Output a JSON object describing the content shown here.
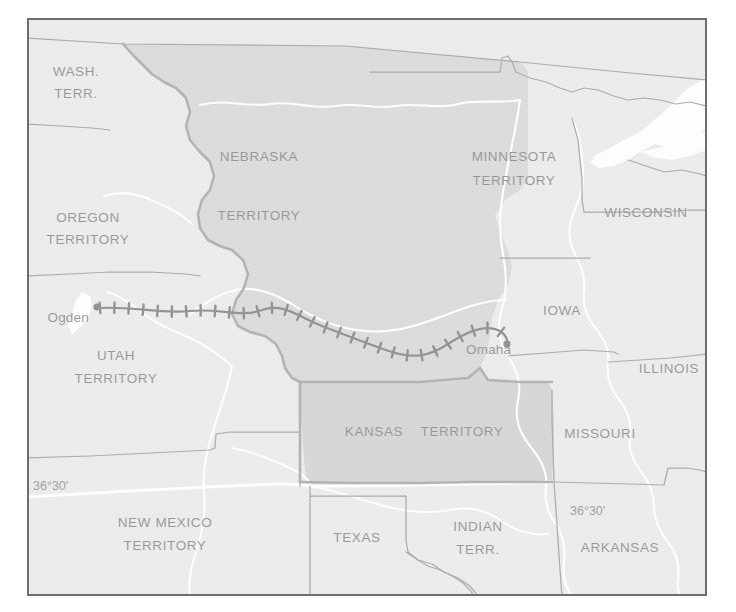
{
  "figure": {
    "kind": "historical-map",
    "frame": {
      "x": 27,
      "y": 18,
      "width": 680,
      "height": 578
    },
    "page_background": "#ffffff",
    "border_color": "#6e6e6e"
  },
  "palette": {
    "page_background": "#ffffff",
    "state_fill_light": "#d6d6d6",
    "territory_fill_mid": "#b4b4b4",
    "territory_fill_dark": "#a8a8a8",
    "water_fill": "#ffffff",
    "river_color": "#ffffff",
    "boundary_thin": "#4a4a4a",
    "boundary_thick": "#5a5a5a",
    "railroad_color": "#141414",
    "label_color": "#1a1a1a",
    "frame_border": "#6e6e6e"
  },
  "regions": [
    {
      "id": "wash-terr",
      "label": "WASH.\nTERR.",
      "lines": [
        "WASH.",
        "TERR."
      ],
      "label_x": 76,
      "label_y": 80,
      "fill": "state_fill_light"
    },
    {
      "id": "oregon-terr",
      "label": "OREGON\nTERRITORY",
      "lines": [
        "OREGON",
        "TERRITORY"
      ],
      "label_x": 88,
      "label_y": 228,
      "fill": "state_fill_light"
    },
    {
      "id": "utah-terr",
      "label": "UTAH\nTERRITORY",
      "lines": [
        "UTAH",
        "TERRITORY"
      ],
      "label_x": 116,
      "label_y": 366,
      "fill": "state_fill_light"
    },
    {
      "id": "new-mexico-terr",
      "label": "NEW MEXICO\nTERRITORY",
      "lines": [
        "NEW MEXICO",
        "TERRITORY"
      ],
      "label_x": 165,
      "label_y": 533,
      "fill": "state_fill_light"
    },
    {
      "id": "nebraska-terr",
      "label": "NEBRASKA\nTERRITORY",
      "lines": [
        "NEBRASKA",
        "TERRITORY"
      ],
      "label_x": 259,
      "label_y": 155,
      "fill": "territory_fill_mid"
    },
    {
      "id": "kansas-terr",
      "label": "KANSAS   TERRITORY",
      "lines": [
        "KANSAS   TERRITORY"
      ],
      "label_x": 400,
      "label_y": 432,
      "fill": "territory_fill_dark"
    },
    {
      "id": "minnesota-terr",
      "label": "MINNESOTA\nTERRITORY",
      "lines": [
        "MINNESOTA",
        "TERRITORY"
      ],
      "label_x": 514,
      "label_y": 155,
      "fill": "state_fill_light"
    },
    {
      "id": "wisconsin",
      "label": "WISCONSIN",
      "lines": [
        "WISCONSIN"
      ],
      "label_x": 642,
      "label_y": 213,
      "fill": "state_fill_light"
    },
    {
      "id": "iowa",
      "label": "IOWA",
      "lines": [
        "IOWA"
      ],
      "label_x": 560,
      "label_y": 311,
      "fill": "state_fill_light"
    },
    {
      "id": "illinois",
      "label": "ILLINOIS",
      "lines": [
        "ILLINOIS"
      ],
      "label_x": 667,
      "label_y": 369,
      "fill": "state_fill_light"
    },
    {
      "id": "missouri",
      "label": "MISSOURI",
      "lines": [
        "MISSOURI"
      ],
      "label_x": 599,
      "label_y": 434,
      "fill": "state_fill_light"
    },
    {
      "id": "arkansas",
      "label": "ARKANSAS",
      "lines": [
        "ARKANSAS"
      ],
      "label_x": 619,
      "label_y": 548,
      "fill": "state_fill_light"
    },
    {
      "id": "indian-terr",
      "label": "INDIAN\nTERR.",
      "lines": [
        "INDIAN",
        "TERR."
      ],
      "label_x": 477,
      "label_y": 531,
      "fill": "state_fill_light"
    },
    {
      "id": "texas",
      "label": "TEXAS",
      "lines": [
        "TEXAS"
      ],
      "label_x": 357,
      "label_y": 538,
      "fill": "state_fill_light"
    }
  ],
  "region_labels": {
    "wash_terr_l1": "WASH.",
    "wash_terr_l2": "TERR.",
    "oregon_l1": "OREGON",
    "oregon_l2": "TERRITORY",
    "utah_l1": "UTAH",
    "utah_l2": "TERRITORY",
    "new_mexico_l1": "NEW MEXICO",
    "new_mexico_l2": "TERRITORY",
    "nebraska_l1": "NEBRASKA",
    "nebraska_l2": "TERRITORY",
    "kansas_l1": "KANSAS",
    "kansas_l2": "TERRITORY",
    "minnesota_l1": "MINNESOTA",
    "minnesota_l2": "TERRITORY",
    "wisconsin": "WISCONSIN",
    "iowa": "IOWA",
    "illinois": "ILLINOIS",
    "missouri": "MISSOURI",
    "arkansas": "ARKANSAS",
    "indian_l1": "INDIAN",
    "indian_l2": "TERR.",
    "texas": "TEXAS"
  },
  "cities": [
    {
      "id": "ogden",
      "name": "Ogden",
      "dot_x": 97,
      "dot_y": 307,
      "label_x": 91,
      "label_y": 318,
      "label_anchor": "end"
    },
    {
      "id": "omaha",
      "name": "Omaha",
      "dot_x": 507,
      "dot_y": 344,
      "label_x": 466,
      "label_y": 350,
      "label_anchor": "start"
    }
  ],
  "city_labels": {
    "ogden": "Ogden",
    "omaha": "Omaha"
  },
  "annotations": [
    {
      "id": "lat-left",
      "text": "36°30'",
      "x": 33,
      "y": 487
    },
    {
      "id": "lat-right",
      "text": "36°30'",
      "x": 570,
      "y": 512
    }
  ],
  "annotation_labels": {
    "lat_left": "36°30'",
    "lat_right": "36°30'"
  },
  "railroad": {
    "id": "transcontinental-railroad",
    "symbol": "hatched-rail-line",
    "from_city": "Ogden",
    "to_city": "Omaha",
    "tie_count": 30,
    "path_points": [
      [
        103,
        308
      ],
      [
        118,
        310
      ],
      [
        133,
        309
      ],
      [
        148,
        311
      ],
      [
        164,
        310
      ],
      [
        180,
        312
      ],
      [
        196,
        311
      ],
      [
        212,
        313
      ],
      [
        228,
        316
      ],
      [
        243,
        312
      ],
      [
        258,
        309
      ],
      [
        273,
        312
      ],
      [
        288,
        318
      ],
      [
        303,
        322
      ],
      [
        318,
        326
      ],
      [
        333,
        330
      ],
      [
        348,
        334
      ],
      [
        362,
        339
      ],
      [
        376,
        345
      ],
      [
        390,
        351
      ],
      [
        404,
        356
      ],
      [
        418,
        357
      ],
      [
        430,
        352
      ],
      [
        443,
        347
      ],
      [
        455,
        340
      ],
      [
        468,
        333
      ],
      [
        481,
        327
      ],
      [
        494,
        328
      ],
      [
        503,
        336
      ],
      [
        507,
        343
      ]
    ]
  },
  "waters": [
    {
      "id": "lake-superior",
      "name": "Lake Superior"
    },
    {
      "id": "great-salt-lake",
      "name": "Great Salt Lake"
    }
  ]
}
